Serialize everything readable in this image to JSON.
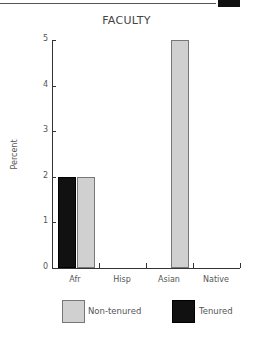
{
  "chart_data": {
    "type": "bar",
    "title": "FACULTY",
    "xlabel": "",
    "ylabel": "Percent",
    "ylim": [
      0,
      5
    ],
    "yticks": [
      0,
      1,
      2,
      3,
      4,
      5
    ],
    "categories": [
      "Afr",
      "Hisp",
      "Asian",
      "Native"
    ],
    "series": [
      {
        "name": "Tenured",
        "color": "#111111",
        "values": [
          2,
          0,
          0,
          0
        ]
      },
      {
        "name": "Non-tenured",
        "color": "#d0d0d0",
        "values": [
          2,
          0,
          5,
          0
        ]
      }
    ],
    "grid": false,
    "legend_position": "bottom"
  },
  "title": "FACULTY",
  "ylabel": "Percent",
  "yticks": [
    "0",
    "1",
    "2",
    "3",
    "4",
    "5"
  ],
  "categories": [
    "Afr",
    "Hisp",
    "Asian",
    "Native"
  ],
  "legend": {
    "non_tenured": "Non-tenured",
    "tenured": "Tenured"
  }
}
